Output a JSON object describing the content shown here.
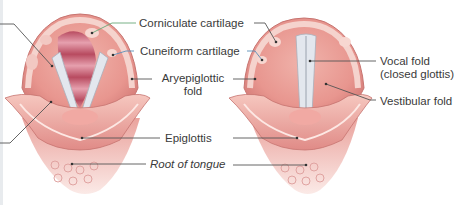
{
  "diagram": {
    "panels": [
      {
        "name": "open-glottis",
        "state": "open"
      },
      {
        "name": "closed-glottis",
        "state": "closed"
      }
    ],
    "labels": {
      "corniculate": "Corniculate cartilage",
      "cuneiform": "Cuneiform cartilage",
      "aryepiglottic_1": "Aryepiglottic",
      "aryepiglottic_2": "fold",
      "epiglottis": "Epiglottis",
      "root_of_tongue": "Root of tongue",
      "vocal_fold_1": "Vocal fold",
      "vocal_fold_2": "(closed glottis)",
      "vestibular_fold": "Vestibular fold"
    },
    "colors": {
      "tissue": "#e89a95",
      "tissue_light": "#f3c4bd",
      "tissue_dark": "#c9706e",
      "trachea": "#c65a6c",
      "vocal_fold": "#dfe3ea",
      "leader_green": "#6aa878",
      "leader_blue": "#5a8fb8",
      "leader_gray": "#555555"
    }
  }
}
